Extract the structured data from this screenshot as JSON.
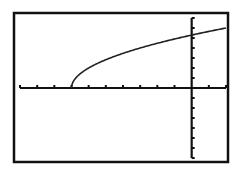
{
  "chart_data": {
    "type": "line",
    "title": "",
    "xlabel": "",
    "ylabel": "",
    "function": "y = 2*sqrt(x + 7)",
    "xlim": [
      -10,
      2
    ],
    "ylim": [
      -7,
      7
    ],
    "x_tick_step": 1,
    "y_tick_step": 1,
    "grid": false,
    "legend": null,
    "series": [
      {
        "name": "curve",
        "x": [
          -7,
          -6.5,
          -6,
          -5,
          -4,
          -3,
          -2,
          -1,
          0,
          1,
          2
        ],
        "y": [
          0,
          1.41,
          2.0,
          2.83,
          3.46,
          4.0,
          4.47,
          4.9,
          5.29,
          5.66,
          6.0
        ]
      }
    ],
    "colors": {
      "axis": "#111111",
      "curve": "#222222",
      "frame": "#111111",
      "background": "#ffffff"
    }
  }
}
